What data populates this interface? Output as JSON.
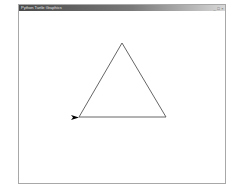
{
  "window": {
    "title": "Python Turtle Graphics",
    "controls": {
      "minimize": "_",
      "maximize": "□",
      "close": "×"
    }
  },
  "canvas": {
    "background": "#ffffff",
    "drawing": {
      "shape": "equilateral triangle",
      "stroke_color": "#555555",
      "turtle_color": "#000000",
      "turtle_heading": "east"
    }
  }
}
